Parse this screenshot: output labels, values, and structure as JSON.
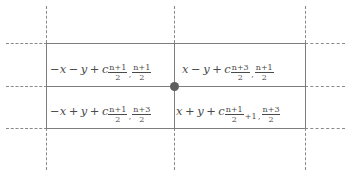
{
  "diagram": {
    "line_color": "#7d7d7d",
    "dash_color": "#8a8a8a",
    "text_color": "#4a4a4a",
    "dot_color": "#5e5e5e",
    "background": "#ffffff",
    "vertex": {
      "label": "center-vertex",
      "x": 174,
      "y": 86
    },
    "cells": [
      {
        "position": "top-left",
        "expression": "-x - y + c_{(n+1)/2, (n+1)/2}",
        "linear_part": {
          "x_term": "−x",
          "operator": "−",
          "y_term": "y",
          "plus": "+",
          "constant_symbol": "c"
        },
        "subscript": {
          "first": {
            "numerator": "n+1",
            "denominator": "2",
            "offset": ""
          },
          "second": {
            "numerator": "n+1",
            "denominator": "2",
            "offset": ""
          },
          "separator": ","
        }
      },
      {
        "position": "top-right",
        "expression": "x - y + c_{(n+3)/2, (n+1)/2}",
        "linear_part": {
          "x_term": "x",
          "operator": "−",
          "y_term": "y",
          "plus": "+",
          "constant_symbol": "c"
        },
        "subscript": {
          "first": {
            "numerator": "n+3",
            "denominator": "2",
            "offset": ""
          },
          "second": {
            "numerator": "n+1",
            "denominator": "2",
            "offset": ""
          },
          "separator": ","
        }
      },
      {
        "position": "bottom-left",
        "expression": "-x + y + c_{(n+1)/2, (n+3)/2}",
        "linear_part": {
          "x_term": "−x",
          "operator": "+",
          "y_term": "y",
          "plus": "+",
          "constant_symbol": "c"
        },
        "subscript": {
          "first": {
            "numerator": "n+1",
            "denominator": "2",
            "offset": ""
          },
          "second": {
            "numerator": "n+3",
            "denominator": "2",
            "offset": ""
          },
          "separator": ","
        }
      },
      {
        "position": "bottom-right",
        "expression": "x + y + c_{(n+1)/2 + 1, (n+3)/2}",
        "linear_part": {
          "x_term": "x",
          "operator": "+",
          "y_term": "y",
          "plus": "+",
          "constant_symbol": "c"
        },
        "subscript": {
          "first": {
            "numerator": "n+1",
            "denominator": "2",
            "offset": "+1"
          },
          "second": {
            "numerator": "n+3",
            "denominator": "2",
            "offset": ""
          },
          "separator": ","
        }
      }
    ]
  }
}
